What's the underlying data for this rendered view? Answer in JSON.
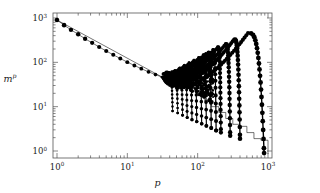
{
  "chart_data": {
    "type": "scatter",
    "title": "",
    "subtitle": "",
    "xlabel": "p",
    "ylabel": "m",
    "ylabel_exponent": "p",
    "xscale": "log",
    "yscale": "log",
    "xlim": [
      1,
      1000
    ],
    "ylim": [
      1,
      1000
    ],
    "grid": false,
    "legend": null,
    "annotations": [],
    "x_ticks": [
      {
        "value": 1,
        "mantissa": "10",
        "exponent": "0",
        "label": "10^0"
      },
      {
        "value": 10,
        "mantissa": "10",
        "exponent": "1",
        "label": "10^1"
      },
      {
        "value": 100,
        "mantissa": "10",
        "exponent": "2",
        "label": "10^2"
      },
      {
        "value": 1000,
        "mantissa": "10",
        "exponent": "3",
        "label": "10^3"
      }
    ],
    "y_ticks": [
      {
        "value": 1,
        "mantissa": "10",
        "exponent": "0",
        "label": "10^0"
      },
      {
        "value": 10,
        "mantissa": "10",
        "exponent": "1",
        "label": "10^1"
      },
      {
        "value": 100,
        "mantissa": "10",
        "exponent": "2",
        "label": "10^2"
      },
      {
        "value": 1000,
        "mantissa": "10",
        "exponent": "3",
        "label": "10^3"
      }
    ],
    "marker": {
      "shape": "filled-circle",
      "color": "#000000",
      "size": 1.9
    },
    "line": {
      "color": "#000000",
      "width": 0.55
    },
    "series": [
      {
        "name": "main-power-law",
        "description": "Descending power-law trunk of moments from p=1 to the onset of branching",
        "x": [
          1,
          1.26,
          1.58,
          2.0,
          2.51,
          3.16,
          3.98,
          5.01,
          6.31,
          7.94,
          10.0,
          12.6,
          15.8,
          20.0,
          25.1,
          31.6
        ],
        "y": [
          900,
          690,
          540,
          430,
          340,
          275,
          222,
          180,
          148,
          122,
          101,
          85,
          72,
          61,
          53,
          46
        ]
      },
      {
        "name": "staircase-envelope",
        "description": "Lower monotone staircase envelope descending to m^p = 1 at p = 1000",
        "x": [
          1,
          31.6,
          50,
          79,
          100,
          126,
          158,
          200,
          251,
          316,
          398,
          501,
          631,
          794,
          1000
        ],
        "y": [
          900,
          46,
          33,
          23,
          18,
          13.5,
          10,
          7.4,
          5.4,
          4.0,
          3.6,
          2.6,
          1.9,
          1.75,
          0.85
        ]
      },
      {
        "name": "branch-arcs",
        "description": "Family of 14 arc-shaped branches fanning upward and right, each rising to a peak then dropping vertically to the staircase",
        "branch_peaks_x": [
          40,
          47,
          55,
          64,
          75,
          88,
          103,
          120,
          141,
          165,
          193,
          250,
          330,
          520
        ],
        "branch_peaks_y": [
          58,
          66,
          75,
          86,
          98,
          112,
          128,
          147,
          168,
          192,
          220,
          260,
          330,
          460
        ],
        "branch_end_x": [
          44,
          52,
          61,
          71,
          83,
          97,
          114,
          133,
          156,
          183,
          214,
          290,
          400,
          880
        ],
        "branch_end_y": [
          8,
          7.2,
          6.4,
          5.7,
          5.1,
          4.6,
          4.1,
          3.7,
          3.3,
          2.9,
          2.6,
          2.2,
          1.9,
          0.9
        ]
      }
    ]
  },
  "figure": {
    "frame_color": "#555555",
    "background": "#ffffff"
  }
}
